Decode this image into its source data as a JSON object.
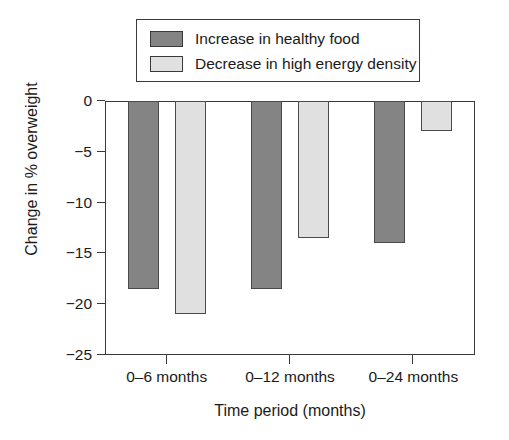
{
  "chart_data": {
    "type": "bar",
    "title": "",
    "xlabel": "Time period (months)",
    "ylabel": "Change in % overweight",
    "categories": [
      "0–6 months",
      "0–12 months",
      "0–24 months"
    ],
    "series": [
      {
        "name": "Increase in healthy food",
        "color": "#848484",
        "values": [
          -18.5,
          -18.5,
          -14
        ]
      },
      {
        "name": "Decrease in high energy density",
        "color": "#e0e0e0",
        "values": [
          -21,
          -13.5,
          -3
        ]
      }
    ],
    "ylim": [
      -25,
      0
    ],
    "ytick_labels": [
      "0",
      "−5",
      "−10",
      "−15",
      "−20",
      "−25"
    ],
    "ytick_values": [
      0,
      -5,
      -10,
      -15,
      -20,
      -25
    ],
    "grid": false,
    "legend_position": "top-center",
    "bar_border_color": "#4a4a4a",
    "axis_color": "#3a3a3a"
  },
  "legend": {
    "items": [
      {
        "label": "Increase in healthy food",
        "swatch": "legend-swatch-dark"
      },
      {
        "label": "Decrease in high energy density",
        "swatch": "legend-swatch-light"
      }
    ]
  }
}
